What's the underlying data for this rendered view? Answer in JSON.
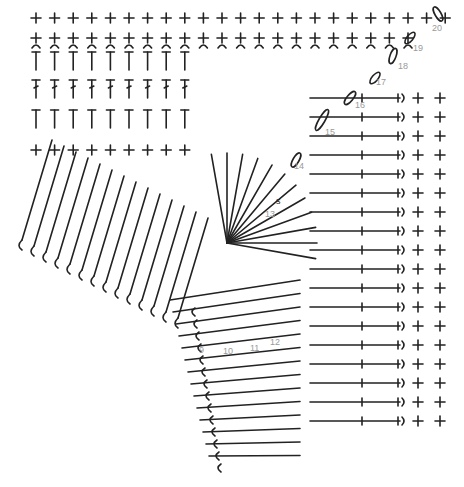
{
  "diagram": {
    "ink_color": "#222222",
    "label_color": "#9a9a9a",
    "row_labels": [
      {
        "text": "9",
        "x": 199,
        "y": 346
      },
      {
        "text": "10",
        "x": 223,
        "y": 347
      },
      {
        "text": "11",
        "x": 250,
        "y": 344
      },
      {
        "text": "12",
        "x": 270,
        "y": 338
      },
      {
        "text": "13",
        "x": 265,
        "y": 210
      },
      {
        "text": "14",
        "x": 294,
        "y": 162
      },
      {
        "text": "15",
        "x": 325,
        "y": 128
      },
      {
        "text": "16",
        "x": 355,
        "y": 101
      },
      {
        "text": "17",
        "x": 376,
        "y": 78
      },
      {
        "text": "18",
        "x": 398,
        "y": 62
      },
      {
        "text": "19",
        "x": 413,
        "y": 44
      },
      {
        "text": "20",
        "x": 432,
        "y": 24
      }
    ],
    "marker_label": {
      "text": "s",
      "x": 276,
      "y": 197
    },
    "center": {
      "x": 227,
      "y": 243
    }
  }
}
